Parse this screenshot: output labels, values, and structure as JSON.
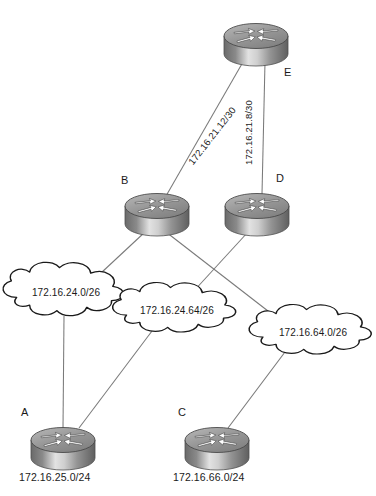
{
  "diagram": {
    "type": "network-topology",
    "title": "",
    "background": "#ffffff",
    "link_color": "#7a7a7a",
    "cloud_outline_color": "#1a1a1a",
    "router_body_dark": "#6e6e6e",
    "router_body_light": "#d8d8d8",
    "router_top_color": "#9a9a9a",
    "routers": [
      {
        "id": "A",
        "label": "A",
        "caption": "172.16.25.0/24",
        "x": 63,
        "y": 446
      },
      {
        "id": "B",
        "label": "B",
        "caption": "",
        "x": 157,
        "y": 212
      },
      {
        "id": "C",
        "label": "C",
        "caption": "172.16.66.0/24",
        "x": 217,
        "y": 446
      },
      {
        "id": "D",
        "label": "D",
        "caption": "",
        "x": 257,
        "y": 212
      },
      {
        "id": "E",
        "label": "E",
        "caption": "",
        "x": 256,
        "y": 42
      }
    ],
    "clouds": [
      {
        "id": "cloud1",
        "label": "172.16.24.0/26",
        "x": 66,
        "y": 293
      },
      {
        "id": "cloud2",
        "label": "172.16.24.64/26",
        "x": 177,
        "y": 311
      },
      {
        "id": "cloud3",
        "label": "172.16.64.0/26",
        "x": 313,
        "y": 333
      }
    ],
    "links": [
      {
        "from": "E",
        "to": "B",
        "label": "172.16.21.12/30",
        "orientation": "diagonal"
      },
      {
        "from": "E",
        "to": "D",
        "label": "172.16.21.8/30",
        "orientation": "vertical"
      },
      {
        "from": "B",
        "to": "cloud1",
        "label": ""
      },
      {
        "from": "B",
        "to": "cloud3",
        "label": ""
      },
      {
        "from": "D",
        "to": "cloud2",
        "label": ""
      },
      {
        "from": "A",
        "to": "cloud1",
        "label": ""
      },
      {
        "from": "A",
        "to": "cloud2",
        "label": ""
      },
      {
        "from": "C",
        "to": "cloud3",
        "label": ""
      }
    ]
  }
}
